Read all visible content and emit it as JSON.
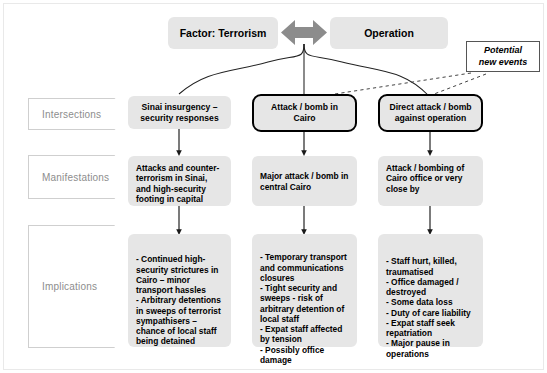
{
  "diagram": {
    "title_bar": {
      "factor": "Factor: Terrorism",
      "operation": "Operation",
      "connector_icon": "double-headed-arrow-icon"
    },
    "callout": {
      "line1": "Potential",
      "line2": "new events"
    },
    "row_labels": [
      {
        "id": "intersections",
        "label": "Intersections"
      },
      {
        "id": "manifestations",
        "label": "Manifestations"
      },
      {
        "id": "implications",
        "label": "Implications"
      }
    ],
    "columns": [
      {
        "id": "col-sinai",
        "highlighted": false,
        "intersection": "Sinai insurgency – security responses",
        "manifestation": "Attacks and counter-terrorism in Sinai, and high-security footing in capital",
        "implications": "- Continued high-security strictures in Cairo – minor transport hassles\n- Arbitrary detentions in sweeps of terrorist sympathisers – chance of local staff being detained"
      },
      {
        "id": "col-cairo",
        "highlighted": true,
        "intersection": "Attack / bomb in Cairo",
        "manifestation": "Major attack / bomb in central Cairo",
        "implications": "- Temporary transport and communications closures\n- Tight security and sweeps - risk of arbitrary detention of local staff\n- Expat staff affected by tension\n- Possibly office damage"
      },
      {
        "id": "col-operation",
        "highlighted": true,
        "intersection": "Direct attack / bomb against operation",
        "manifestation": "Attack / bombing of Cairo office or very close by",
        "implications": "- Staff hurt, killed, traumatised\n- Office damaged / destroyed\n- Some data loss\n- Duty of care liability\n- Expat staff seek repatriation\n- Major pause in operations"
      }
    ],
    "colors": {
      "box_fill": "#e6e6e6",
      "arrow_fill": "#8c8c8c",
      "label_text": "#8d8d8d",
      "label_border": "#cfcfcf",
      "line": "#222222",
      "frame": "#e9e9e9"
    }
  }
}
